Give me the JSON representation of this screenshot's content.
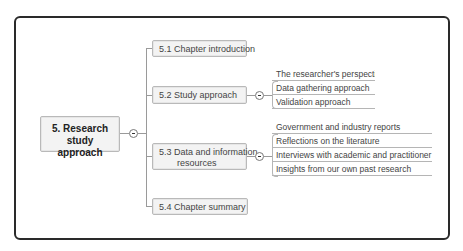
{
  "mindmap": {
    "root": {
      "label": "5. Research study approach"
    },
    "branches": [
      {
        "label": "5.1 Chapter introduction",
        "children": []
      },
      {
        "label": "5.2 Study approach",
        "children": [
          "The researcher's perspective",
          "Data gathering approach",
          "Validation approach"
        ]
      },
      {
        "label_line1": "5.3 Data and information",
        "label_line2": "resources",
        "children": [
          "Government and industry reports",
          "Reflections on the literature",
          "Interviews with academic and practitioner SME",
          "Insights from our own past research"
        ]
      },
      {
        "label": "5.4 Chapter summary",
        "children": []
      }
    ]
  },
  "colors": {
    "frame": "#2a2a2a",
    "node_fill": "#f3f3f3",
    "node_border": "#b9b9b9",
    "connector": "#9a9a9a"
  }
}
